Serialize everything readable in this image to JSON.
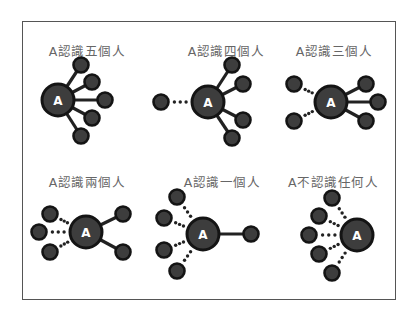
{
  "colors": {
    "node_fill": "#3d3d3d",
    "node_stroke": "#141414",
    "center_label": "#ffffff",
    "edge": "#222222",
    "title_text": "#666666",
    "frame": "#555555"
  },
  "center_label": "A",
  "panels": [
    {
      "title": "A認識五個人",
      "title_pos": [
        87,
        41
      ],
      "center": [
        58,
        100
      ],
      "known": [
        [
          81,
          65
        ],
        [
          92,
          82
        ],
        [
          105,
          100
        ],
        [
          92,
          118
        ],
        [
          81,
          136
        ]
      ],
      "unknown": []
    },
    {
      "title": "A認識四個人",
      "title_pos": [
        226,
        41
      ],
      "center": [
        208,
        102
      ],
      "known": [
        [
          232,
          65
        ],
        [
          243,
          84
        ],
        [
          243,
          120
        ],
        [
          232,
          138
        ]
      ],
      "unknown": [
        [
          161,
          102
        ]
      ]
    },
    {
      "title": "A認識三個人",
      "title_pos": [
        334,
        41
      ],
      "center": [
        331,
        102
      ],
      "known": [
        [
          366,
          84
        ],
        [
          378,
          102
        ],
        [
          366,
          121
        ]
      ],
      "unknown": [
        [
          294,
          84
        ],
        [
          294,
          121
        ]
      ]
    },
    {
      "title": "A認識兩個人",
      "title_pos": [
        87,
        172
      ],
      "center": [
        86,
        232
      ],
      "known": [
        [
          123,
          214
        ],
        [
          123,
          252
        ]
      ],
      "unknown": [
        [
          50,
          214
        ],
        [
          39,
          232
        ],
        [
          50,
          252
        ]
      ]
    },
    {
      "title": "A認識一個人",
      "title_pos": [
        222,
        172
      ],
      "center": [
        203,
        234
      ],
      "known": [
        [
          251,
          234
        ]
      ],
      "unknown": [
        [
          177,
          197
        ],
        [
          164,
          218
        ],
        [
          164,
          250
        ],
        [
          177,
          271
        ]
      ]
    },
    {
      "title": "A不認識任何人",
      "title_pos": [
        333,
        172
      ],
      "center": [
        357,
        235
      ],
      "known": [],
      "unknown": [
        [
          332,
          198
        ],
        [
          319,
          216
        ],
        [
          309,
          235
        ],
        [
          319,
          254
        ],
        [
          332,
          273
        ]
      ]
    }
  ]
}
